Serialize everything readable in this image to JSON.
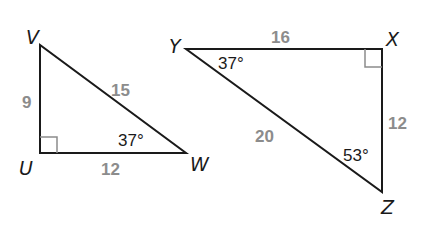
{
  "figure": {
    "triangles": [
      {
        "name": "UVW",
        "vertices": {
          "V": "V",
          "U": "U",
          "W": "W"
        },
        "right_angle_at": "U",
        "sides": {
          "VU": "9",
          "UW": "12",
          "VW": "15"
        },
        "angles": {
          "W": "37°"
        }
      },
      {
        "name": "XYZ",
        "vertices": {
          "Y": "Y",
          "X": "X",
          "Z": "Z"
        },
        "right_angle_at": "X",
        "sides": {
          "YX": "16",
          "XZ": "12",
          "YZ": "20"
        },
        "angles": {
          "Y": "37°",
          "Z": "53°"
        }
      }
    ],
    "colors": {
      "line": "#1a1a1a",
      "side_label": "#8c8c8c",
      "right_angle_mark": "#8c8c8c"
    }
  }
}
